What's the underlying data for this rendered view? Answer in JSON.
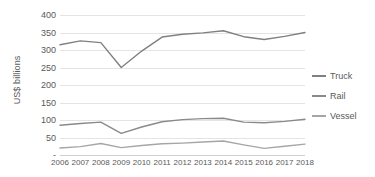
{
  "chart_data": {
    "type": "line",
    "title": "",
    "xlabel": "",
    "ylabel": "US$ billions",
    "categories": [
      "2006",
      "2007",
      "2008",
      "2009",
      "2010",
      "2011",
      "2012",
      "2013",
      "2014",
      "2015",
      "2016",
      "2017",
      "2018"
    ],
    "series": [
      {
        "name": "Truck",
        "color": "#808080",
        "values": [
          315,
          326,
          321,
          250,
          297,
          337,
          345,
          349,
          355,
          338,
          330,
          339,
          350
        ]
      },
      {
        "name": "Rail",
        "color": "#8a8a8a",
        "values": [
          85,
          90,
          94,
          62,
          80,
          95,
          101,
          104,
          105,
          94,
          92,
          96,
          102
        ]
      },
      {
        "name": "Vessel",
        "color": "#a6a6a6",
        "values": [
          20,
          24,
          33,
          21,
          27,
          32,
          34,
          37,
          40,
          29,
          19,
          25,
          31
        ]
      }
    ],
    "ylim": [
      0,
      400
    ],
    "y_ticks": [
      {
        "value": 400,
        "label": "400"
      },
      {
        "value": 350,
        "label": "350"
      },
      {
        "value": 300,
        "label": "300"
      },
      {
        "value": 250,
        "label": "250"
      },
      {
        "value": 200,
        "label": "200"
      },
      {
        "value": 150,
        "label": "150"
      },
      {
        "value": 100,
        "label": "100"
      },
      {
        "value": 50,
        "label": "50"
      },
      {
        "value": 0,
        "label": "-"
      }
    ],
    "grid": true,
    "legend_position": "right",
    "legend": [
      "Truck",
      "Rail",
      "Vessel"
    ]
  }
}
